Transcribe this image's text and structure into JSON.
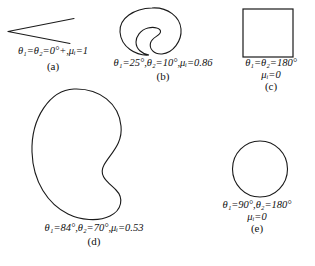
{
  "figure": {
    "background_color": "#ffffff",
    "stroke_color": "#1a1a1a",
    "width": 315,
    "height": 266
  },
  "panels": [
    {
      "id": "a",
      "letter": "(a)",
      "shape": "thin-wedge",
      "caption_lines": [
        "θ₁=θ₂=0°+,μᵢ=1"
      ],
      "theta1": "0°+",
      "theta2": "0°+",
      "mu_i": "1"
    },
    {
      "id": "b",
      "letter": "(b)",
      "shape": "small-bean",
      "caption_lines": [
        "θ₁=25°,θ₂=10°,μᵢ=0.86"
      ],
      "theta1": "25°",
      "theta2": "10°",
      "mu_i": "0.86"
    },
    {
      "id": "c",
      "letter": "(c)",
      "shape": "square",
      "caption_lines": [
        "θ₁=θ₂=180°",
        "μᵢ=0"
      ],
      "theta1": "180°",
      "theta2": "180°",
      "mu_i": "0"
    },
    {
      "id": "d",
      "letter": "(d)",
      "shape": "large-bean",
      "caption_lines": [
        "θ₁=84°,θ₂=70°,μᵢ=0.53"
      ],
      "theta1": "84°",
      "theta2": "70°",
      "mu_i": "0.53"
    },
    {
      "id": "e",
      "letter": "(e)",
      "shape": "circle",
      "caption_lines": [
        "θ₁=90°,θ₂=180°",
        "μᵢ=0"
      ],
      "theta1": "90°",
      "theta2": "180°",
      "mu_i": "0"
    }
  ]
}
